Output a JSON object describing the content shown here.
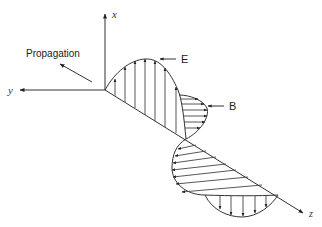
{
  "axes": {
    "x_label": "x",
    "y_label": "y",
    "z_label": "z"
  },
  "labels": {
    "propagation": "Propagation",
    "electric_field": "E",
    "magnetic_field": "B"
  },
  "colors": {
    "line": "#333333",
    "background": "#ffffff"
  }
}
